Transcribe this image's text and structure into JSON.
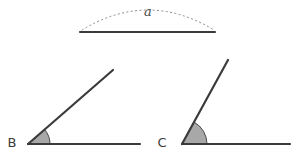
{
  "figure": {
    "background_color": "#ffffff",
    "line_color": "#3b3b3b",
    "arc_fill_color": "#a8a8a8",
    "arc_stroke_color": "#4a4a4a",
    "dotted_arc_color": "#8a8a8a"
  },
  "reference": {
    "label": "a",
    "label_x": 148,
    "label_y": 16,
    "segment": {
      "x1": 80,
      "y1": 32,
      "x2": 215,
      "y2": 32,
      "stroke_width": 2.2
    },
    "dotted_arc": {
      "x1": 82,
      "y1": 30,
      "x2": 214,
      "y2": 30,
      "peak_y": 10,
      "dash": "1.2 3.2",
      "stroke_width": 1
    }
  },
  "angles": [
    {
      "name": "angle-b",
      "vertex_label": "B",
      "label_x": 12,
      "label_y": 147,
      "vertex_x": 28,
      "vertex_y": 144,
      "base_ray": {
        "x2": 140,
        "y2": 144
      },
      "slant_ray": {
        "x2": 113,
        "y2": 70
      },
      "degrees": 33,
      "arc_radius": 22,
      "stroke_width": 2.2
    },
    {
      "name": "angle-c",
      "vertex_label": "C",
      "label_x": 162,
      "label_y": 147,
      "vertex_x": 182,
      "vertex_y": 144,
      "base_ray": {
        "x2": 290,
        "y2": 144
      },
      "slant_ray": {
        "x2": 228,
        "y2": 60
      },
      "degrees": 60,
      "arc_radius": 25,
      "stroke_width": 2.2
    }
  ]
}
